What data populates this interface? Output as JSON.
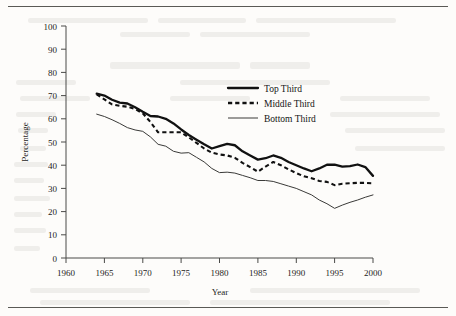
{
  "page": {
    "background_color": "#fdfcfa",
    "rule_color": "#5a5a56",
    "has_top_rule": true,
    "has_bottom_rule": true
  },
  "chart_data": {
    "type": "line",
    "title": "",
    "xlabel": "Year",
    "ylabel": "Percentage",
    "xlim": [
      1960,
      2000
    ],
    "ylim": [
      0,
      100
    ],
    "xticks": [
      1960,
      1965,
      1970,
      1975,
      1980,
      1985,
      1990,
      1995,
      2000
    ],
    "yticks": [
      0,
      10,
      20,
      30,
      40,
      50,
      60,
      70,
      80,
      90,
      100
    ],
    "grid": false,
    "legend_position": "upper right",
    "x": [
      1964,
      1965,
      1966,
      1967,
      1968,
      1969,
      1970,
      1971,
      1972,
      1973,
      1974,
      1975,
      1976,
      1977,
      1978,
      1979,
      1980,
      1981,
      1982,
      1983,
      1984,
      1985,
      1986,
      1987,
      1988,
      1989,
      1990,
      1991,
      1992,
      1993,
      1994,
      1995,
      1996,
      1997,
      1998,
      1999,
      2000
    ],
    "series": [
      {
        "name": "Top Third",
        "style": "solid-thick",
        "color": "#111111",
        "values": [
          70.8,
          70.0,
          68.2,
          67.0,
          66.6,
          65.0,
          63.0,
          61.2,
          61.0,
          60.0,
          58.0,
          55.4,
          53.0,
          51.0,
          49.0,
          47.2,
          48.2,
          49.2,
          48.6,
          46.0,
          44.2,
          42.4,
          43.0,
          44.2,
          43.2,
          41.4,
          40.0,
          38.6,
          37.4,
          38.6,
          40.2,
          40.2,
          39.4,
          39.6,
          40.3,
          39.2,
          35.4
        ]
      },
      {
        "name": "Middle Third",
        "style": "dashed",
        "color": "#111111",
        "values": [
          70.5,
          68.4,
          66.2,
          65.6,
          65.2,
          64.2,
          62.4,
          58.6,
          54.2,
          54.2,
          54.2,
          54.2,
          52.0,
          49.6,
          47.2,
          45.4,
          44.6,
          44.2,
          43.2,
          41.0,
          39.2,
          37.2,
          39.4,
          41.4,
          40.0,
          38.2,
          36.6,
          35.2,
          34.4,
          33.2,
          32.8,
          31.4,
          32.0,
          32.2,
          32.4,
          32.4,
          32.2
        ]
      },
      {
        "name": "Bottom Third",
        "style": "solid-thin",
        "color": "#3a3a38",
        "values": [
          62.0,
          61.0,
          59.6,
          58.0,
          56.2,
          55.2,
          54.6,
          52.2,
          49.0,
          48.2,
          46.0,
          45.2,
          45.4,
          43.4,
          41.4,
          38.6,
          36.8,
          37.0,
          36.6,
          35.6,
          34.6,
          33.4,
          33.4,
          33.0,
          32.0,
          31.0,
          30.0,
          28.6,
          27.2,
          25.0,
          23.4,
          21.4,
          22.8,
          24.0,
          25.0,
          26.2,
          27.2
        ]
      }
    ],
    "legend": [
      {
        "label": "Top Third",
        "style": "solid-thick"
      },
      {
        "label": "Middle Third",
        "style": "dashed"
      },
      {
        "label": "Bottom Third",
        "style": "solid-thin"
      }
    ]
  }
}
